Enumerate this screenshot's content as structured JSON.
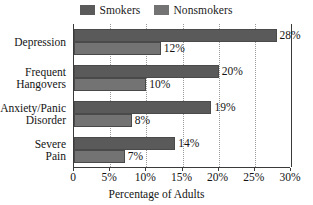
{
  "chart_data": {
    "type": "bar",
    "orientation": "horizontal",
    "title": "",
    "subtitle": "",
    "xlabel": "Percentage of Adults",
    "ylabel": "",
    "categories": [
      "Depression",
      "Frequent Hangovers",
      "Anxiety/Panic Disorder",
      "Severe Pain"
    ],
    "series": [
      {
        "name": "Smokers",
        "values": [
          28,
          20,
          19,
          14
        ],
        "color": "#5a5a5a"
      },
      {
        "name": "Nonsmokers",
        "values": [
          12,
          10,
          8,
          7
        ],
        "color": "#737373"
      }
    ],
    "value_labels": [
      [
        "28%",
        "12%"
      ],
      [
        "20%",
        "10%"
      ],
      [
        "19%",
        "8%"
      ],
      [
        "14%",
        "7%"
      ]
    ],
    "xlim": [
      0,
      30
    ],
    "xticks": [
      0,
      5,
      10,
      15,
      20,
      25,
      30
    ],
    "xtick_labels": [
      "0",
      "5%",
      "10%",
      "15%",
      "20%",
      "25%",
      "30%"
    ],
    "grid": true,
    "grid_axis": "x",
    "legend_position": "top-center"
  },
  "legend": {
    "entries": [
      {
        "label": "Smokers",
        "color": "#5a5a5a"
      },
      {
        "label": "Nonsmokers",
        "color": "#737373"
      }
    ]
  },
  "category_labels": [
    {
      "lines": [
        "Depression"
      ]
    },
    {
      "lines": [
        "Frequent",
        "Hangovers"
      ]
    },
    {
      "lines": [
        "Anxiety/Panic",
        "Disorder"
      ]
    },
    {
      "lines": [
        "Severe",
        "Pain"
      ]
    }
  ],
  "axis": {
    "x_title": "Percentage of Adults",
    "tick_labels": [
      "0",
      "5%",
      "10%",
      "15%",
      "20%",
      "25%",
      "30%"
    ]
  },
  "colors": {
    "smokers": "#5a5a5a",
    "nonsmokers": "#737373",
    "axis": "#3a3a3a",
    "grid": "#9a9a9a",
    "background": "#ffffff",
    "text": "#141414"
  }
}
